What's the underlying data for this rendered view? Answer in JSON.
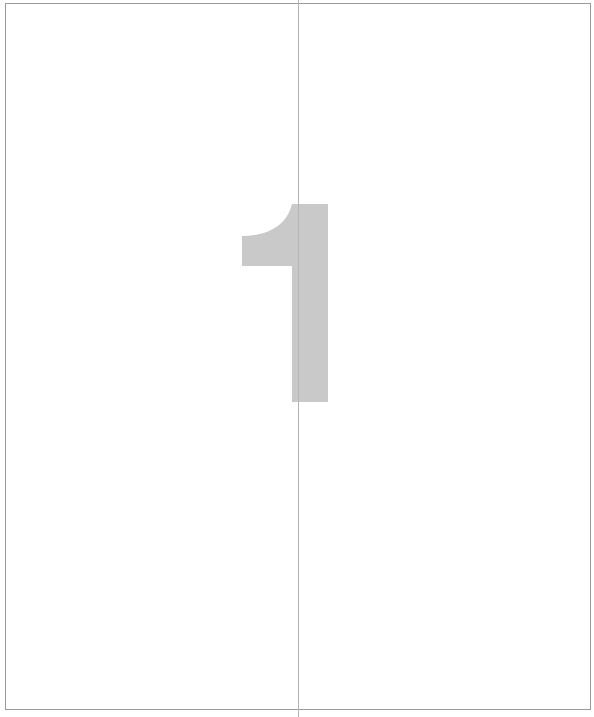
{
  "page": {
    "numeral": "1",
    "numeral_color": "#c9c9c9",
    "frame_color": "#9a9a9a",
    "fold_line_color": "#b4b4b4"
  }
}
